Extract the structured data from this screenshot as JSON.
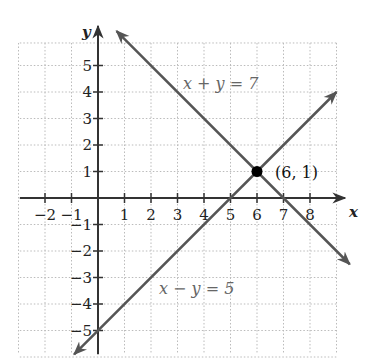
{
  "chart_data": {
    "type": "line",
    "title": "",
    "xlabel": "x",
    "ylabel": "y",
    "xlim": [
      -3,
      9
    ],
    "ylim": [
      -6,
      6
    ],
    "grid": true,
    "x_ticks": [
      -2,
      -1,
      1,
      2,
      3,
      4,
      5,
      6,
      7,
      8
    ],
    "x_tick_labels": [
      "−2",
      "−1",
      "1",
      "2",
      "3",
      "4",
      "5",
      "6",
      "7",
      "8"
    ],
    "y_ticks": [
      5,
      4,
      3,
      2,
      1,
      -1,
      -2,
      -3,
      -4,
      -5
    ],
    "y_tick_labels": [
      "5",
      "4",
      "3",
      "2",
      "1",
      "−1",
      "−2",
      "−3",
      "−4",
      "−5"
    ],
    "series": [
      {
        "name": "x + y = 7",
        "equation": "x + y = 7",
        "x": [
          0.7,
          9.5
        ],
        "y": [
          6.3,
          -2.5
        ],
        "color": "#555555",
        "arrows": "both"
      },
      {
        "name": "x − y = 5",
        "equation": "x − y = 5",
        "x": [
          -0.9,
          9.0
        ],
        "y": [
          -5.9,
          4.0
        ],
        "color": "#555555",
        "arrows": "both"
      }
    ],
    "points": [
      {
        "x": 6,
        "y": 1,
        "label": "(6, 1)",
        "color": "#000000"
      }
    ],
    "annotations": [
      {
        "text": "x + y = 7",
        "x": 3.2,
        "y": 4.3
      },
      {
        "text": "x − y = 5",
        "x": 2.3,
        "y": -3.4
      },
      {
        "text": "(6, 1)",
        "x": 6.4,
        "y": 1
      }
    ]
  },
  "labels": {
    "x_axis": "x",
    "y_axis": "y",
    "eq1": "x + y = 7",
    "eq2": "x − y = 5",
    "point": "(6, 1)"
  }
}
